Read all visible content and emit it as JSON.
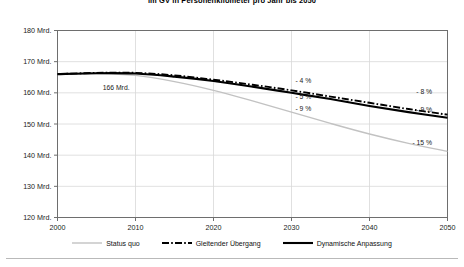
{
  "chart_data": {
    "type": "line",
    "title": "im GV in Personenkilometer pro Jahr bis 2050",
    "xlabel": "",
    "ylabel": "",
    "xlim": [
      2000,
      2050
    ],
    "ylim": [
      120,
      180
    ],
    "y_tick_suffix": "Mrd.",
    "grid": true,
    "legend_position": "bottom",
    "xticks": [
      "2000",
      "2010",
      "2020",
      "2030",
      "2040",
      "2050"
    ],
    "yticks": [
      "180 Mrd.",
      "170 Mrd.",
      "160 Mrd.",
      "150 Mrd.",
      "140 Mrd.",
      "130 Mrd.",
      "120 Mrd."
    ],
    "x": [
      2000,
      2005,
      2010,
      2015,
      2020,
      2025,
      2030,
      2035,
      2040,
      2045,
      2050
    ],
    "series": [
      {
        "name": "Status quo",
        "style": "solid-light",
        "color": "#c2c2c2",
        "values": [
          166.0,
          166.2,
          165.6,
          163.6,
          160.8,
          157.4,
          153.8,
          150.2,
          146.8,
          143.8,
          141.2
        ]
      },
      {
        "name": "Gleitender Übergang",
        "style": "dash-dot",
        "color": "#000000",
        "values": [
          166.0,
          166.4,
          166.4,
          165.6,
          164.2,
          162.6,
          160.8,
          158.8,
          156.8,
          154.8,
          153.0
        ]
      },
      {
        "name": "Dynamische Anpassung",
        "style": "solid-thick",
        "color": "#000000",
        "values": [
          166.0,
          166.3,
          166.2,
          165.2,
          163.8,
          162.0,
          160.0,
          158.0,
          155.8,
          153.8,
          152.0
        ]
      }
    ],
    "annotations": [
      {
        "text": "166 Mrd.",
        "x": 2005.8,
        "y": 161.0
      },
      {
        "text": "- 4 %",
        "x": 2030.5,
        "y": 163.2
      },
      {
        "text": "- 5 %",
        "x": 2030.5,
        "y": 158.1
      },
      {
        "text": "- 9 %",
        "x": 2030.5,
        "y": 154.2
      },
      {
        "text": "- 8 %",
        "x": 2046.0,
        "y": 159.6
      },
      {
        "text": "- 9 %",
        "x": 2046.0,
        "y": 153.8
      },
      {
        "text": "- 15 %",
        "x": 2045.5,
        "y": 143.3
      }
    ],
    "legend": [
      {
        "label": "Status quo",
        "style": "solid-light"
      },
      {
        "label": "Gleitender Übergang",
        "style": "dash-dot"
      },
      {
        "label": "Dynamische Anpassung",
        "style": "solid-thick"
      }
    ]
  }
}
